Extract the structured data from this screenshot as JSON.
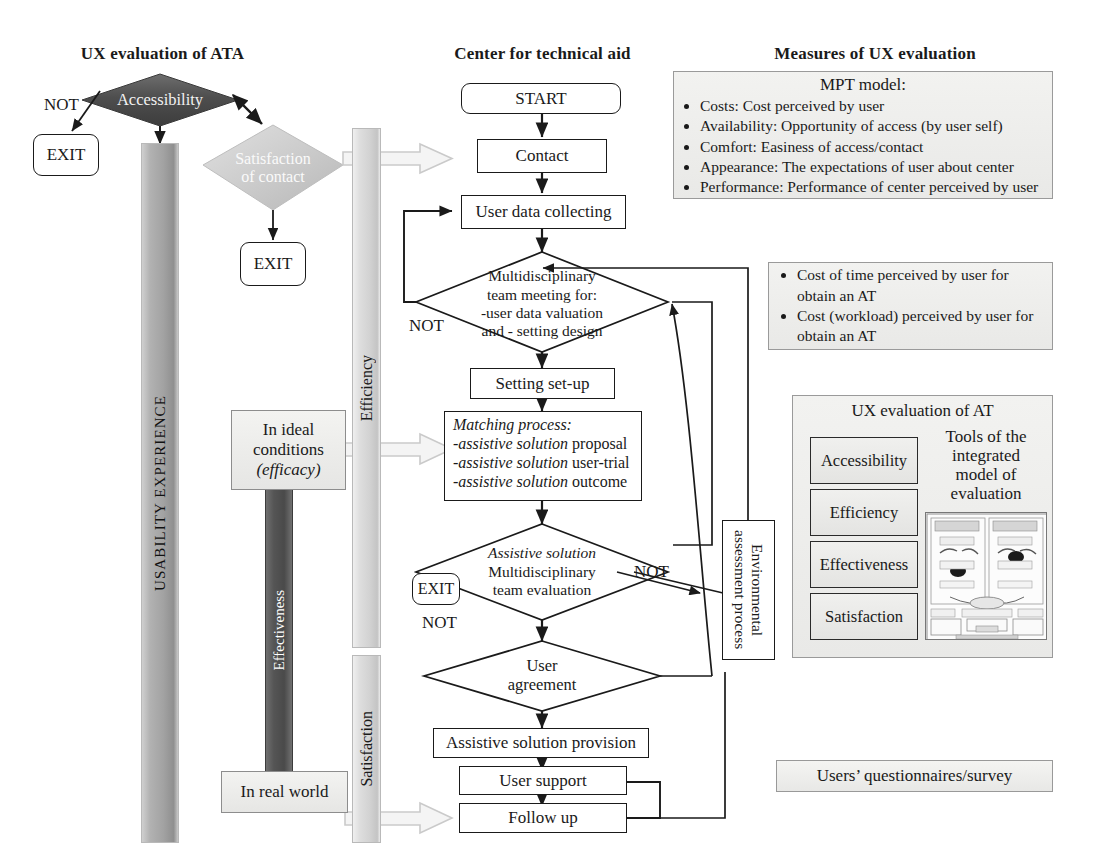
{
  "headings": {
    "left": "UX evaluation of ATA",
    "center": "Center for technical aid",
    "right": "Measures of UX evaluation"
  },
  "left_column": {
    "accessibility_diamond": "Accessibility",
    "satisfaction_diamond": "Satisfaction\nof contact",
    "not_label_1": "NOT",
    "exit_1": "EXIT",
    "exit_2": "EXIT",
    "usability_bar": "USABILITY EXPERIENCE",
    "efficiency_bar": "Efficiency",
    "satisfaction_bar": "Satisfaction",
    "effectiveness_bar": "Effectiveness",
    "ideal_conditions_line1": "In ideal",
    "ideal_conditions_line2": "conditions",
    "ideal_conditions_line3": "(efficacy)",
    "real_world": "In real world"
  },
  "flow": {
    "start": "START",
    "contact": "Contact",
    "user_data_collecting": "User data collecting",
    "multidisciplinary_l1": "Multidisciplinary",
    "multidisciplinary_l2": "team meeting for:",
    "multidisciplinary_l3": "-user data valuation",
    "multidisciplinary_l4": "and - setting design",
    "not_label_multi": "NOT",
    "setting_setup": "Setting set-up",
    "matching_title": "Matching process:",
    "matching_l1_i": "-assistive solution",
    "matching_l1_r": " proposal",
    "matching_l2_i": "-assistive solution",
    "matching_l2_r": " user-trial",
    "matching_l3_i": "-assistive solution",
    "matching_l3_r": " outcome",
    "assistive_eval_l1": "Assistive solution",
    "assistive_eval_l2": "Multidisciplinary",
    "assistive_eval_l3": "team evaluation",
    "not_label_assistive": "NOT",
    "exit_3": "EXIT",
    "not_label_agreement": "NOT",
    "user_agreement_l1": "User",
    "user_agreement_l2": "agreement",
    "assistive_provision": "Assistive solution provision",
    "user_support": "User support",
    "follow_up": "Follow up",
    "environmental_assessment": "Environmental\nassessment process"
  },
  "right_column": {
    "mpt_title": "MPT model:",
    "mpt_items": [
      "Costs: Cost perceived by user",
      "Availability: Opportunity of access (by user self)",
      "Comfort: Easiness of access/contact",
      "Appearance: The expectations of user about center",
      "Performance: Performance of center perceived by user"
    ],
    "cost_items": [
      "Cost of time perceived by user for obtain an AT",
      "Cost (workload) perceived by user for obtain an AT"
    ],
    "ux_at_title": "UX evaluation of AT",
    "measures": [
      "Accessibility",
      "Efficiency",
      "Effectiveness",
      "Satisfaction"
    ],
    "tools_l1": "Tools of the",
    "tools_l2": "integrated",
    "tools_l3": "model of",
    "tools_l4": "evaluation",
    "survey": "Users’ questionnaires/survey"
  },
  "colors": {
    "ink": "#1a1a1a",
    "accessibility_fill": "#595959",
    "satisfaction_fill": "#c6c6c6",
    "panel_fill": "#ededeb",
    "effectiveness_fill": "#4f4f4f",
    "block_arrow_fill": "#f2f2f2",
    "block_arrow_stroke": "#bdbdbd"
  }
}
